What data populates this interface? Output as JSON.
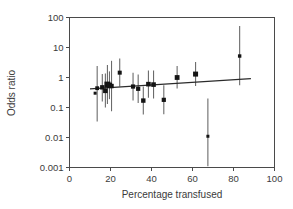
{
  "chart_data": {
    "type": "scatter",
    "title": "",
    "xlabel": "Percentage transfused",
    "ylabel": "Odds ratio",
    "xlim": [
      0,
      100
    ],
    "ylim": [
      0.001,
      100
    ],
    "yscale": "log",
    "xscale": "linear",
    "grid": false,
    "legend": null,
    "xticks": [
      0,
      20,
      40,
      60,
      80,
      100
    ],
    "xtick_labels": [
      "0",
      "20",
      "40",
      "60",
      "80",
      "100"
    ],
    "yticks": [
      0.001,
      0.01,
      0.1,
      1,
      10,
      100
    ],
    "ytick_labels": [
      "0.001",
      "0.01",
      "0.1",
      "1",
      "10",
      "100"
    ],
    "marker": "square",
    "points": [
      {
        "x": 12.5,
        "y": 0.3,
        "lo": 0.3,
        "hi": 0.3,
        "size": 3.0
      },
      {
        "x": 13.5,
        "y": 0.44,
        "lo": 0.034,
        "hi": 2.4,
        "size": 3.8
      },
      {
        "x": 16.0,
        "y": 0.47,
        "lo": 0.16,
        "hi": 1.3,
        "size": 4.4
      },
      {
        "x": 17.5,
        "y": 0.36,
        "lo": 0.1,
        "hi": 1.35,
        "size": 4.6
      },
      {
        "x": 18.5,
        "y": 0.58,
        "lo": 0.13,
        "hi": 2.6,
        "size": 6.0
      },
      {
        "x": 19.5,
        "y": 0.55,
        "lo": 0.19,
        "hi": 1.6,
        "size": 5.2
      },
      {
        "x": 20.5,
        "y": 0.52,
        "lo": 0.075,
        "hi": 3.6,
        "size": 4.4
      },
      {
        "x": 24.5,
        "y": 1.45,
        "lo": 0.5,
        "hi": 4.3,
        "size": 4.0
      },
      {
        "x": 31.0,
        "y": 0.5,
        "lo": 0.17,
        "hi": 1.45,
        "size": 4.2
      },
      {
        "x": 33.5,
        "y": 0.42,
        "lo": 0.14,
        "hi": 1.25,
        "size": 4.2
      },
      {
        "x": 36.0,
        "y": 0.17,
        "lo": 0.058,
        "hi": 0.5,
        "size": 4.4
      },
      {
        "x": 38.5,
        "y": 0.6,
        "lo": 0.21,
        "hi": 1.7,
        "size": 4.6
      },
      {
        "x": 41.0,
        "y": 0.58,
        "lo": 0.2,
        "hi": 1.7,
        "size": 4.6
      },
      {
        "x": 46.0,
        "y": 0.18,
        "lo": 0.06,
        "hi": 0.55,
        "size": 4.2
      },
      {
        "x": 52.5,
        "y": 1.0,
        "lo": 0.43,
        "hi": 2.4,
        "size": 4.8
      },
      {
        "x": 61.5,
        "y": 1.3,
        "lo": 0.52,
        "hi": 3.3,
        "size": 5.0
      },
      {
        "x": 67.5,
        "y": 0.011,
        "lo": 0.0011,
        "hi": 0.2,
        "size": 3.0
      },
      {
        "x": 83.0,
        "y": 5.2,
        "lo": 0.55,
        "hi": 52.0,
        "size": 3.4
      }
    ],
    "fit_line": {
      "x_start": 10.0,
      "y_start": 0.42,
      "x_end": 88.5,
      "y_end": 0.92
    }
  }
}
